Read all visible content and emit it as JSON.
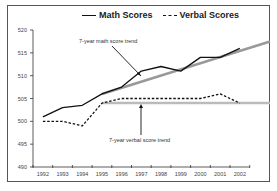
{
  "chart_data": {
    "type": "line",
    "title": "",
    "xlabel": "",
    "ylabel": "",
    "categories": [
      "1992",
      "1993",
      "1994",
      "1995",
      "1996",
      "1997",
      "1998",
      "1999",
      "2000",
      "2001",
      "2002"
    ],
    "series": [
      {
        "name": "Math Scores",
        "style": "solid",
        "color": "#111111",
        "values": [
          501,
          503,
          503.5,
          506,
          507.5,
          511,
          512,
          511,
          514,
          514,
          516
        ]
      },
      {
        "name": "Verbal Scores",
        "style": "dashed",
        "color": "#111111",
        "values": [
          500,
          500,
          499,
          504,
          505,
          505,
          505,
          505,
          505,
          506,
          504
        ]
      }
    ],
    "trendlines": [
      {
        "label": "7-year math score trend",
        "color": "#999999",
        "from": {
          "x": "1995",
          "y": 506
        },
        "to": {
          "x": "2002+",
          "y": 517.5
        }
      },
      {
        "label": "7-year verbal score trend",
        "color": "#bbbbbb",
        "from": {
          "x": "1995",
          "y": 504
        },
        "to": {
          "x": "2002+",
          "y": 504
        }
      }
    ],
    "yticks": [
      490,
      495,
      500,
      505,
      510,
      515,
      520
    ],
    "ylim": [
      490,
      520
    ],
    "grid": false,
    "legend_position": "top"
  },
  "legend": {
    "math_label": "Math Scores",
    "verbal_label": "Verbal Scores"
  },
  "annotations": {
    "math_trend": "7-year math score trend",
    "verbal_trend": "7-year verbal score trend"
  }
}
